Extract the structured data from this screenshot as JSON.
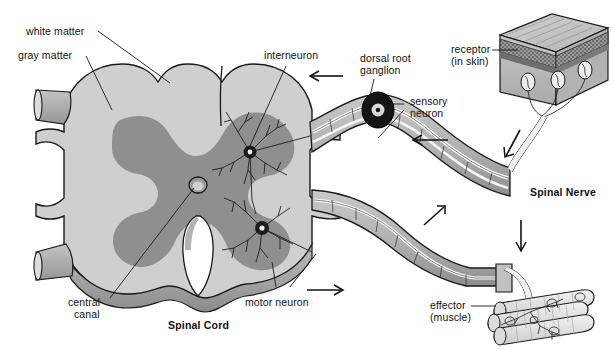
{
  "figure": {
    "title_main": "Spinal Cord",
    "title_nerve": "Spinal Nerve",
    "type": "biological-diagram"
  },
  "labels": {
    "white_matter": "white matter",
    "gray_matter": "gray matter",
    "interneuron": "interneuron",
    "dorsal_root_ganglion_l1": "dorsal root",
    "dorsal_root_ganglion_l2": "ganglion",
    "sensory_neuron_l1": "sensory",
    "sensory_neuron_l2": "neuron",
    "receptor_l1": "receptor",
    "receptor_l2": "(in skin)",
    "central_canal_l1": "central",
    "central_canal_l2": "canal",
    "motor_neuron": "motor neuron",
    "effector_l1": "effector",
    "effector_l2": "(muscle)",
    "spinal_cord": "Spinal Cord",
    "spinal_nerve": "Spinal Nerve"
  },
  "colors": {
    "white_matter_fill": "#cfcfcf",
    "gray_matter_fill": "#8f8f8f",
    "nerve_fill": "#b6b6b6",
    "outline": "#1a1a1a",
    "text": "#111111",
    "skin_top": "#c6c6c6",
    "skin_face": "#bdbdbd",
    "muscle_fill": "#e2e2e2",
    "background": "#ffffff"
  },
  "flow_arrows": [
    {
      "name": "arrow-dorsal-inbound-left",
      "direction": "left"
    },
    {
      "name": "arrow-dorsal-inbound-right",
      "direction": "left"
    },
    {
      "name": "arrow-ventral-outbound",
      "direction": "right"
    },
    {
      "name": "arrow-ventral-upright",
      "direction": "up-right"
    },
    {
      "name": "arrow-receptor-down",
      "direction": "down-left"
    },
    {
      "name": "arrow-effector-down",
      "direction": "down"
    }
  ]
}
